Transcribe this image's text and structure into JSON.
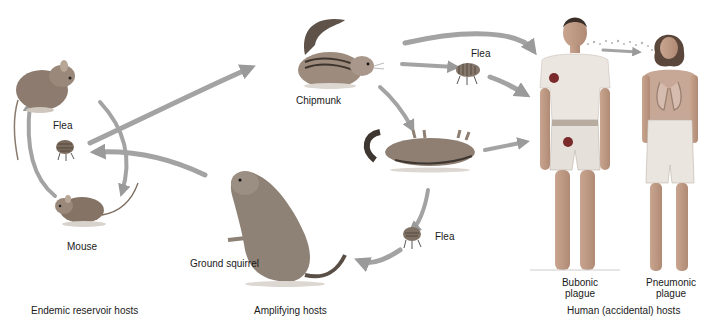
{
  "diagram": {
    "type": "plague-transmission-cycle",
    "colors": {
      "arrow": "#9a9a9a",
      "background": "#ffffff",
      "text": "#1a1a1a",
      "bubo": "#7a2a2a"
    },
    "groups": [
      {
        "id": "endemic",
        "label": "Endemic reservoir hosts"
      },
      {
        "id": "amplifying",
        "label": "Amplifying hosts"
      },
      {
        "id": "human",
        "label": "Human (accidental) hosts"
      }
    ],
    "nodes": {
      "rodent_top": {
        "label": ""
      },
      "flea_left": {
        "label": "Flea"
      },
      "mouse": {
        "label": "Mouse"
      },
      "chipmunk": {
        "label": "Chipmunk"
      },
      "flea_top": {
        "label": "Flea"
      },
      "dead_chipmunk": {
        "label": ""
      },
      "flea_bottom": {
        "label": "Flea"
      },
      "ground_squirrel": {
        "label": "Ground squirrel"
      },
      "bubonic": {
        "label_line1": "Bubonic",
        "label_line2": "plague"
      },
      "pneumonic": {
        "label_line1": "Pneumonic",
        "label_line2": "plague"
      }
    },
    "edges": [
      {
        "from": "rodent_top",
        "to": "mouse"
      },
      {
        "from": "mouse",
        "to": "rodent_top"
      },
      {
        "from": "flea_left",
        "to": "chipmunk"
      },
      {
        "from": "ground_squirrel",
        "to": "flea_left"
      },
      {
        "from": "chipmunk",
        "to": "bubonic"
      },
      {
        "from": "chipmunk",
        "to": "flea_top"
      },
      {
        "from": "flea_top",
        "to": "bubonic"
      },
      {
        "from": "chipmunk",
        "to": "dead_chipmunk"
      },
      {
        "from": "dead_chipmunk",
        "to": "bubonic"
      },
      {
        "from": "dead_chipmunk",
        "to": "flea_bottom"
      },
      {
        "from": "flea_bottom",
        "to": "ground_squirrel"
      },
      {
        "from": "bubonic",
        "to": "pneumonic"
      }
    ]
  }
}
